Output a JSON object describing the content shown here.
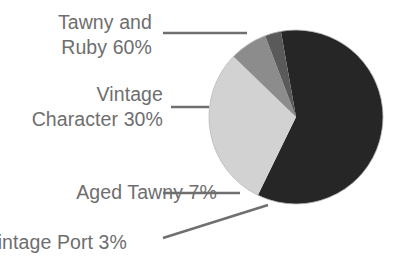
{
  "chart_data": {
    "type": "pie",
    "title": "",
    "subtitle": "",
    "xlabel": "",
    "ylabel": "",
    "legend_position": "callout-labels-left",
    "grid": false,
    "categories": [
      "Tawny and Ruby",
      "Vintage Character",
      "Aged Tawny",
      "Vintage Port"
    ],
    "values": [
      60,
      30,
      7,
      3
    ],
    "unit": "%",
    "slices": [
      {
        "name": "Tawny and Ruby",
        "value": 60,
        "label": "Tawny and Ruby 60%",
        "label_lines": [
          "Tawny and",
          "Ruby 60%"
        ],
        "color": "#262626",
        "start_angle_deg": -10,
        "sweep_deg": 216
      },
      {
        "name": "Vintage Character",
        "value": 30,
        "label": "Vintage Character 30%",
        "label_lines": [
          "Vintage",
          "Character 30%"
        ],
        "color": "#d2d2d2",
        "start_angle_deg": 242,
        "sweep_deg": 108
      },
      {
        "name": "Aged Tawny",
        "value": 7,
        "label": "Aged Tawny 7%",
        "label_lines": [
          "Aged Tawny 7%"
        ],
        "color": "#8c8c8c",
        "start_angle_deg": 206,
        "sweep_deg": 25.2
      },
      {
        "name": "Vintage Port",
        "value": 3,
        "label": "Vintage Port 3%",
        "label_lines": [
          "Vintage Port 3%"
        ],
        "color": "#5a5a5a",
        "start_angle_deg": 195.2,
        "sweep_deg": 10.8
      }
    ],
    "colors": {
      "tawny_and_ruby": "#262626",
      "vintage_character": "#d2d2d2",
      "aged_tawny": "#8c8c8c",
      "vintage_port": "#5a5a5a",
      "label_text": "#6e6e6e",
      "leader_line": "#7a7a7a",
      "background": "#ffffff"
    }
  },
  "labels": {
    "tawny_ruby": "Tawny and\nRuby 60%",
    "vintage_character": "Vintage\nCharacter 30%",
    "aged_tawny": "Aged Tawny 7%",
    "vintage_port": "Vintage Port 3%"
  }
}
